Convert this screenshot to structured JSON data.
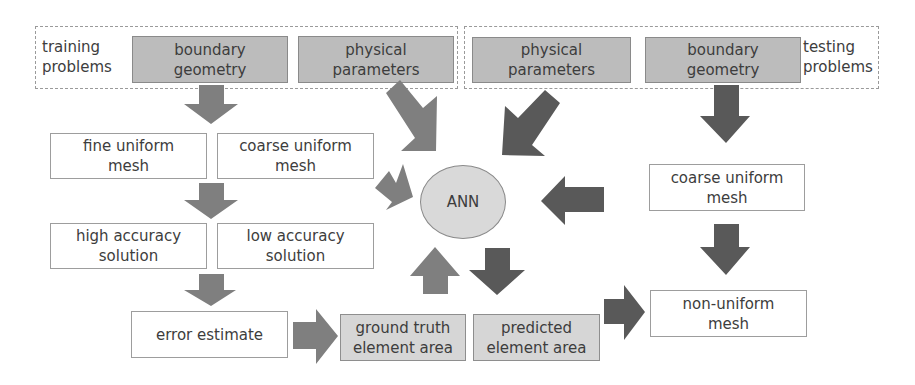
{
  "training": {
    "label_line1": "training",
    "label_line2": "problems",
    "boundary_geometry": {
      "line1": "boundary",
      "line2": "geometry"
    },
    "physical_parameters": {
      "line1": "physical",
      "line2": "parameters"
    }
  },
  "testing": {
    "label_line1": "testing",
    "label_line2": "problems",
    "physical_parameters": {
      "line1": "physical",
      "line2": "parameters"
    },
    "boundary_geometry": {
      "line1": "boundary",
      "line2": "geometry"
    }
  },
  "nodes": {
    "fine_uniform_mesh": {
      "line1": "fine uniform",
      "line2": "mesh"
    },
    "coarse_uniform_mesh_train": {
      "line1": "coarse uniform",
      "line2": "mesh"
    },
    "high_accuracy_solution": {
      "line1": "high accuracy",
      "line2": "solution"
    },
    "low_accuracy_solution": {
      "line1": "low accuracy",
      "line2": "solution"
    },
    "error_estimate": {
      "line1": "error estimate"
    },
    "ground_truth_element_area": {
      "line1": "ground truth",
      "line2": "element area"
    },
    "predicted_element_area": {
      "line1": "predicted",
      "line2": "element area"
    },
    "ann": {
      "label": "ANN"
    },
    "coarse_uniform_mesh_test": {
      "line1": "coarse uniform",
      "line2": "mesh"
    },
    "non_uniform_mesh": {
      "line1": "non-uniform",
      "line2": "mesh"
    }
  },
  "colors": {
    "training_arrow": "#7f7f7f",
    "testing_arrow": "#595959",
    "input_box_fill": "#bcbcbc",
    "area_box_fill": "#d6d6d6",
    "ann_fill": "#d9d9d9"
  }
}
